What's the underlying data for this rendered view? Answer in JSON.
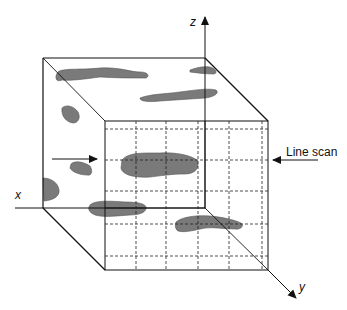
{
  "diagram": {
    "axes": {
      "x_label": "x",
      "y_label": "y",
      "z_label": "z"
    },
    "annotation": {
      "line_scan_label": "Line scan"
    },
    "colors": {
      "stroke": "#111111",
      "inclusion_fill": "#7a7a7a",
      "background": "#ffffff"
    },
    "grid": {
      "columns": 5,
      "rows": 5,
      "style": "dashed"
    }
  }
}
